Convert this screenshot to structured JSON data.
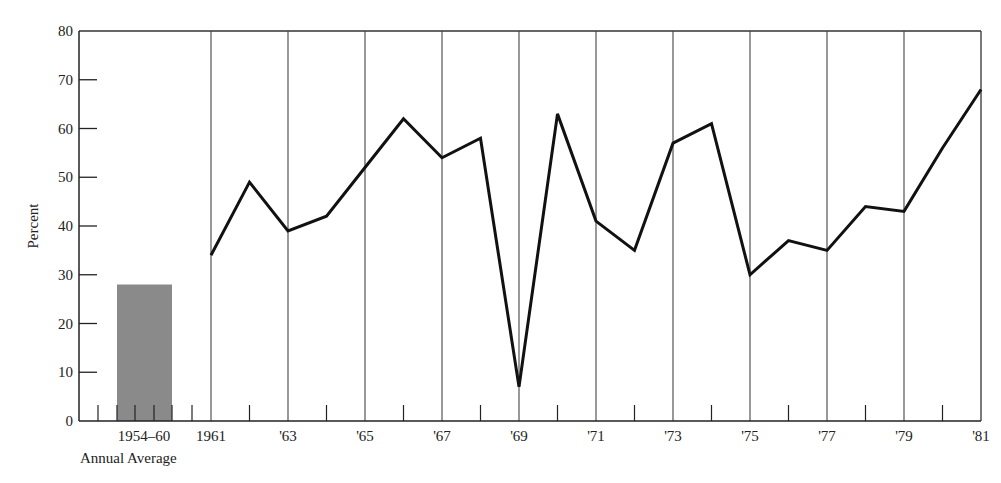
{
  "chart_data": {
    "type": "line",
    "title": "",
    "xlabel": "",
    "ylabel": "Percent",
    "ylim": [
      0,
      80
    ],
    "yticks": [
      0,
      10,
      20,
      30,
      40,
      50,
      60,
      70,
      80
    ],
    "grid": "vertical lines at odd years",
    "x": [
      1961,
      1962,
      1963,
      1964,
      1965,
      1966,
      1967,
      1968,
      1969,
      1970,
      1971,
      1972,
      1973,
      1974,
      1975,
      1976,
      1977,
      1978,
      1979,
      1980,
      1981
    ],
    "values": [
      34,
      49,
      39,
      42,
      52,
      62,
      54,
      58,
      7,
      63,
      41,
      35,
      57,
      61,
      30,
      37,
      35,
      44,
      43,
      56,
      68
    ],
    "xtick_labels": [
      "1961",
      "'63",
      "'65",
      "'67",
      "'69",
      "'71",
      "'73",
      "'75",
      "'77",
      "'79",
      "'81"
    ],
    "baseline_bar": {
      "label": "1954–60",
      "sublabel": "Annual Average",
      "value": 28,
      "color": "#8a8a8a"
    },
    "line_color": "#111111"
  }
}
